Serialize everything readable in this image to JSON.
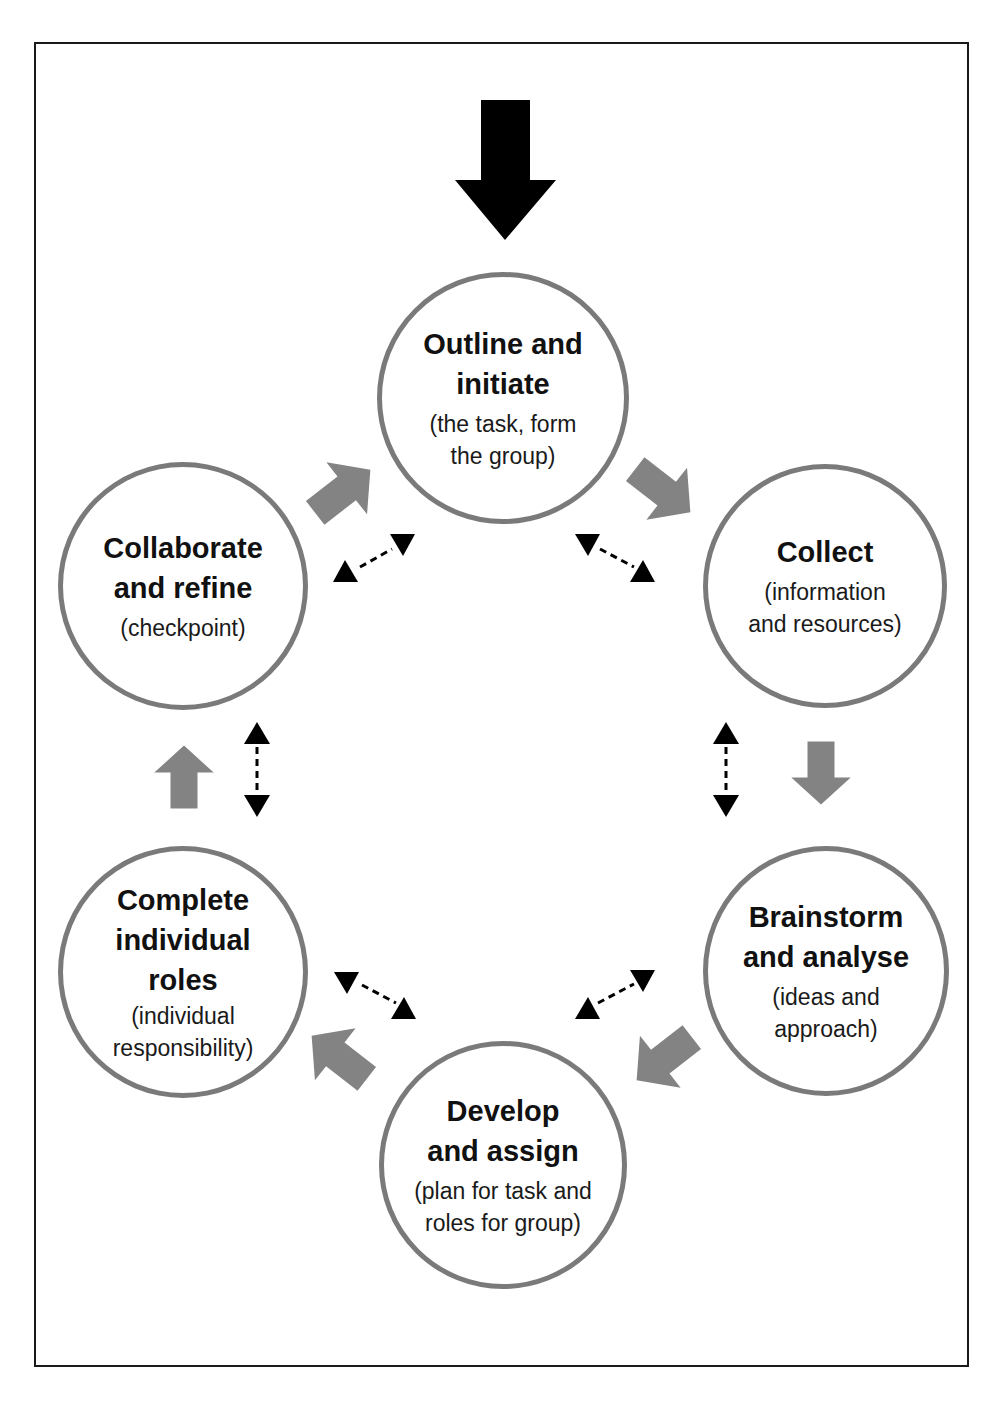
{
  "diagram": {
    "type": "cycle",
    "colors": {
      "node_border": "#7a7a7a",
      "flow_arrow": "#838383",
      "start_arrow": "#000000",
      "bidirectional_arrow": "#000000",
      "frame_border": "#1a1a1a"
    },
    "start_arrow": {
      "direction": "down",
      "target": "outline"
    },
    "nodes": [
      {
        "id": "outline",
        "title": "Outline and\ninitiate",
        "subtitle": "(the task, form\nthe group)"
      },
      {
        "id": "collect",
        "title": "Collect",
        "subtitle": "(information\nand resources)"
      },
      {
        "id": "brainstorm",
        "title": "Brainstorm\nand analyse",
        "subtitle": "(ideas and\napproach)"
      },
      {
        "id": "develop",
        "title": "Develop\nand assign",
        "subtitle": "(plan for task and\nroles for group)"
      },
      {
        "id": "complete",
        "title": "Complete\nindividual\nroles",
        "subtitle": "(individual\nresponsibility)"
      },
      {
        "id": "collaborate",
        "title": "Collaborate\nand refine",
        "subtitle": "(checkpoint)"
      }
    ],
    "flow_edges": [
      {
        "from": "outline",
        "to": "collect"
      },
      {
        "from": "collect",
        "to": "brainstorm"
      },
      {
        "from": "brainstorm",
        "to": "develop"
      },
      {
        "from": "develop",
        "to": "complete"
      },
      {
        "from": "complete",
        "to": "collaborate"
      },
      {
        "from": "collaborate",
        "to": "outline"
      }
    ],
    "bidirectional_edges": [
      {
        "a": "outline",
        "b": "collect",
        "style": "dashed"
      },
      {
        "a": "collect",
        "b": "brainstorm",
        "style": "dashed"
      },
      {
        "a": "brainstorm",
        "b": "develop",
        "style": "dashed"
      },
      {
        "a": "develop",
        "b": "complete",
        "style": "dashed"
      },
      {
        "a": "complete",
        "b": "collaborate",
        "style": "dashed"
      },
      {
        "a": "collaborate",
        "b": "outline",
        "style": "dashed"
      }
    ]
  }
}
